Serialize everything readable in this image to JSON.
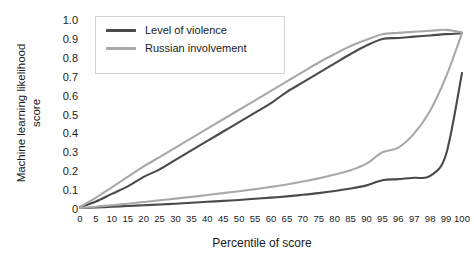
{
  "chart_data": {
    "type": "line",
    "title": "",
    "xlabel": "Percentile of score",
    "ylabel": "Machine learning likelihood score",
    "ylabel_lines": [
      "Machine learning likelihood",
      "score"
    ],
    "grid": false,
    "legend_position": "top-left",
    "xlim": [
      0,
      100
    ],
    "ylim": [
      0,
      1.0
    ],
    "x_scale_note": "categorical equal spacing of irregular percentile ticks",
    "xticks": [
      0,
      5,
      10,
      15,
      20,
      25,
      30,
      35,
      40,
      45,
      50,
      55,
      60,
      65,
      70,
      75,
      80,
      85,
      90,
      95,
      96,
      97,
      98,
      99,
      100
    ],
    "xtick_labels": [
      "0",
      "5",
      "10",
      "15",
      "20",
      "25",
      "30",
      "35",
      "40",
      "45",
      "50",
      "55",
      "60",
      "65",
      "70",
      "75",
      "80",
      "85",
      "90",
      "95",
      "96",
      "97",
      "98",
      "99",
      "100"
    ],
    "yticks": [
      0,
      0.1,
      0.2,
      0.3,
      0.4,
      0.5,
      0.6,
      0.7,
      0.8,
      0.9,
      1.0
    ],
    "ytick_labels": [
      "0",
      "0.1",
      "0.2",
      "0.3",
      "0.4",
      "0.5",
      "0.6",
      "0.7",
      "0.8",
      "0.9",
      "1.0"
    ],
    "series": [
      {
        "name": "Level of violence (upper)",
        "legend": "Level of violence",
        "color": "#4a4a4a",
        "values": [
          0.01,
          0.04,
          0.08,
          0.12,
          0.17,
          0.21,
          0.26,
          0.31,
          0.36,
          0.41,
          0.46,
          0.51,
          0.56,
          0.62,
          0.67,
          0.72,
          0.77,
          0.82,
          0.865,
          0.9,
          0.905,
          0.912,
          0.918,
          0.925,
          0.93
        ]
      },
      {
        "name": "Russian involvement (upper)",
        "legend": "Russian involvement",
        "color": "#a8a8a8",
        "values": [
          0.01,
          0.06,
          0.115,
          0.17,
          0.225,
          0.275,
          0.325,
          0.375,
          0.425,
          0.475,
          0.525,
          0.575,
          0.625,
          0.675,
          0.725,
          0.775,
          0.82,
          0.862,
          0.895,
          0.925,
          0.932,
          0.938,
          0.943,
          0.948,
          0.935
        ]
      },
      {
        "name": "Level of violence (lower)",
        "legend": "Level of violence",
        "color": "#4a4a4a",
        "values": [
          0.005,
          0.008,
          0.012,
          0.016,
          0.02,
          0.024,
          0.028,
          0.033,
          0.038,
          0.043,
          0.048,
          0.054,
          0.06,
          0.067,
          0.075,
          0.084,
          0.095,
          0.108,
          0.125,
          0.152,
          0.158,
          0.165,
          0.175,
          0.29,
          0.72
        ]
      },
      {
        "name": "Russian involvement (lower)",
        "legend": "Russian involvement",
        "color": "#a8a8a8",
        "values": [
          0.005,
          0.012,
          0.02,
          0.028,
          0.037,
          0.046,
          0.055,
          0.064,
          0.074,
          0.084,
          0.094,
          0.105,
          0.117,
          0.13,
          0.145,
          0.162,
          0.182,
          0.205,
          0.24,
          0.3,
          0.325,
          0.4,
          0.52,
          0.7,
          0.93
        ]
      }
    ],
    "legend_entries": [
      {
        "label": "Level of violence",
        "color": "#4a4a4a"
      },
      {
        "label": "Russian involvement",
        "color": "#a8a8a8"
      }
    ]
  },
  "legend": {
    "item0_label": "Level of violence",
    "item1_label": "Russian involvement"
  },
  "axes": {
    "x_title": "Percentile of score",
    "y_title_line1": "Machine learning likelihood",
    "y_title_line2": "score"
  },
  "colors": {
    "dark_line": "#4a4a4a",
    "light_line": "#a8a8a8",
    "text": "#1a1a1a",
    "legend_border": "#d5d5d5",
    "background": "#ffffff"
  }
}
